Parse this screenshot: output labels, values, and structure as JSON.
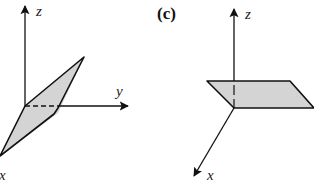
{
  "figure": {
    "panels": [
      {
        "id": "b-partial",
        "label": "",
        "axes": {
          "z": "z",
          "y": "y",
          "x": "x"
        },
        "shape": "tilted parallelogram plane through origin",
        "fill_color": "#d4d4d4"
      },
      {
        "id": "c",
        "label": "(c)",
        "axes": {
          "z": "z",
          "x": "x"
        },
        "shape": "horizontal parallelogram plane",
        "fill_color": "#d4d4d4"
      }
    ],
    "line_color": "#111111"
  }
}
